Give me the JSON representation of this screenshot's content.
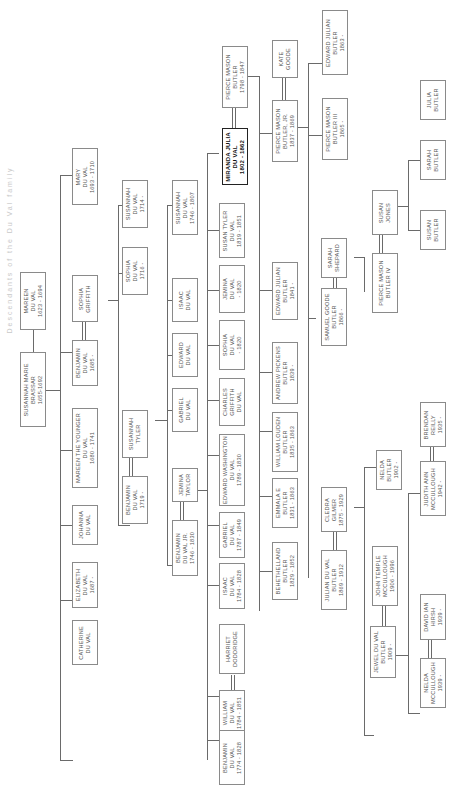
{
  "title": "Descendants of the Du Val family",
  "people": {
    "mareen": "MAREEN\nDU VAL\n1623 - 1694",
    "susannah_brassar": "SUSANNAH MARIE\nBRASSAR\n1655-1692",
    "mary": "MARY\nDU VAL\n1693 - 1710",
    "sophia_griffith": "SOPHIA\nGRIFFITH",
    "benjamin_1685": "BENJAMIN\nDU VAL\n1685 -",
    "mareen_younger": "MAREEN THE YOUNGER\nDU VAL\n1680 - 1741",
    "johanna": "JOHANNA\nDU VAL",
    "elizabeth": "ELIZABETH\nDU VAL\n1687 -",
    "catherine": "CATHERINE\nDU VAL",
    "susannah_1714": "SUSANNAH\nDU VAL\n1714 -",
    "sophia_1716": "SOPHIA\nDU VAL\n1716 -",
    "susannah_tyler": "SUSANNAH\nTYLER",
    "benjamin_1719": "BENJAMIN\nDU VAL\n1719 -",
    "susannah_1746": "SUSANNAH\nDU VAL\n1746 - 1807",
    "isaac": "ISAAC\nDU VAL",
    "edward": "EDWARD\nDU VAL",
    "gabriel": "GABRIEL\nDU VAL",
    "jemina_taylor": "JEMINA\nTAYLOR",
    "benjamin_jr": "BENJAMIN\nDU VAL JR.\n1746 - 1830",
    "pierce_1798": "PIERCE MASON\nBUTLER\n1798 - 1847",
    "miranda": "MIRANDA JULIA\nDU VAL\n1802 - 1862",
    "susan_tyler": "SUSAN TYLER\nDU VAL\n1819 - 1851",
    "jemina_1820": "JEMINA\nDU VAL\n- 1820",
    "sophia_1820": "SOPHIA\nDU VAL\n- 1820",
    "charles_griffith": "CHARLES\nGRIFFITH\nDU VAL",
    "edward_washington": "EDWARD WASHINGTON\nDU VAL\n1789 - 1830",
    "gabriel_1787": "GABRIEL\nDU VAL\n1787 - 1849",
    "isaac_1784": "ISAAC\nDU VAL\n1784 - 1828",
    "harriet": "HARRIET\nDODDRIDGE",
    "william_1784": "WILLIAM\nDU VAL\n1784 - 1851",
    "benjamin_1774": "BENJAMIN\nDU VAL\n1774 - 1828",
    "kate_goode": "KATE\nGOODE",
    "pierce_jr": "PIERCE MASON\nBUTLER, JR.\n1837 - 1869",
    "edward_julian_1841": "EDWARD JULIAN\nBUTLER\n1841 -",
    "andrew_pickens": "ANDREW PICKENS\nBUTLER\n1839 -",
    "william_louden": "WILLIAM LOUDEN\nBUTLER\n1835 - 1863",
    "emmala": "EMMALA E\nBUTLER\n1831 - 1863",
    "behethelland": "BEHETHELLAND\nBUTLER\n1829 - 1852",
    "edward_julian_1863": "EDWARD JULIAN\nBUTLER\n1863 -",
    "pierce_iii": "PIERCE MASON\nBUTLER III\n1865 -",
    "sarah_shepard": "SARAH\nSHEPARD",
    "samuel_goode": "SAMUEL GOODE\nBUTLER\n1866 -",
    "cledra": "CLEDRA\nGILMER\n1875 - 1929",
    "julian_du_val": "JULIAN DU VAL\nBUTLER\n1869 - 1912",
    "julia_butler": "JULIA\nBUTLER",
    "sarah_butler": "SARAH\nBUTLER",
    "susan_butler": "SUSAN\nBUTLER",
    "susan_jones": "SUSAN\nJONES",
    "pierce_iv": "PIERCE MASON\nBUTLER IV",
    "nelda_butler": "NELDA\nBUTLER\n1902 -",
    "john_temple": "JOHN TEMPLE\nMCCULLOUGH\n1906 - 1996",
    "jewel": "JEWEL DU VAL\nBUTLER\n1909 -",
    "brendan": "BRENDAN\nREILLY\n1935 -",
    "judith": "JUDITH ANN\nMCCULLOUGH\n1942 -",
    "david": "DAVID IAN\nHIRSH\n1939 -",
    "nelda_mccullough": "NELDA\nMCCULLOUGH\n1939 -"
  }
}
